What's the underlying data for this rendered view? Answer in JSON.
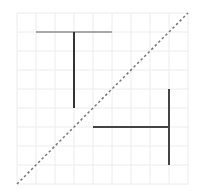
{
  "diagram": {
    "type": "reflection-on-grid",
    "grid": {
      "origin_x": 17,
      "origin_y": 13,
      "cell_size": 19,
      "columns": 9,
      "rows": 9,
      "line_color": "#ececec"
    },
    "mirror_line": {
      "style": "dashed",
      "color": "#777777",
      "from": {
        "col": 0,
        "row": 9
      },
      "to": {
        "col": 9,
        "row": 0
      }
    },
    "original_shape": {
      "name": "T-shape",
      "segments": [
        {
          "part": "crossbar",
          "from": {
            "col": 1,
            "row": 1
          },
          "to": {
            "col": 5,
            "row": 1
          },
          "color": "#a8a8a8"
        },
        {
          "part": "stem",
          "from": {
            "col": 3,
            "row": 1
          },
          "to": {
            "col": 3,
            "row": 5
          },
          "color": "#333333"
        }
      ]
    },
    "reflected_shape": {
      "name": "reflected-T-shape",
      "segments": [
        {
          "part": "crossbar",
          "from": {
            "col": 8,
            "row": 4
          },
          "to": {
            "col": 8,
            "row": 8
          },
          "color": "#444444"
        },
        {
          "part": "stem",
          "from": {
            "col": 4,
            "row": 6
          },
          "to": {
            "col": 8,
            "row": 6
          },
          "color": "#444444"
        }
      ]
    }
  }
}
